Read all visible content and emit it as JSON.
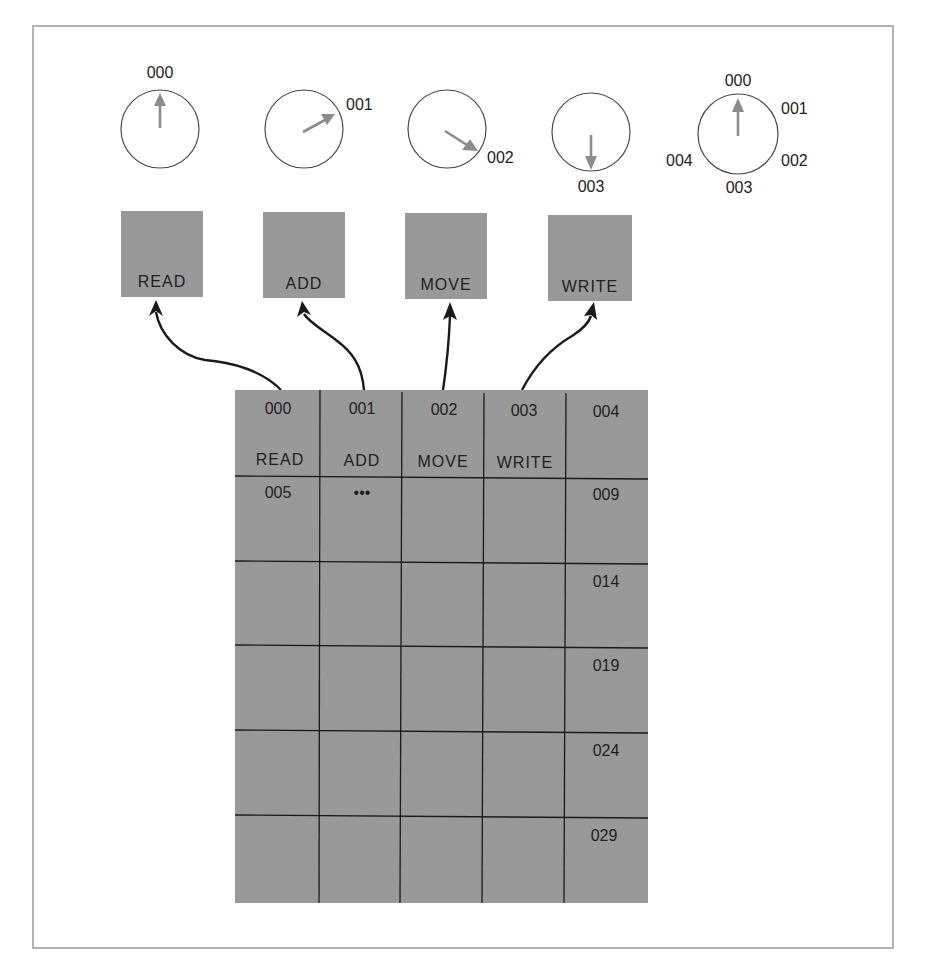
{
  "dials": [
    {
      "label": "000",
      "angle_deg": 0
    },
    {
      "label": "001",
      "angle_deg": 62
    },
    {
      "label": "002",
      "angle_deg": 120
    },
    {
      "label": "003",
      "angle_deg": 180
    }
  ],
  "legend_dial": {
    "pointer_label": "000",
    "positions": [
      "000",
      "001",
      "002",
      "003",
      "004"
    ]
  },
  "instruction_boxes": [
    {
      "label": "READ"
    },
    {
      "label": "ADD"
    },
    {
      "label": "MOVE"
    },
    {
      "label": "WRITE"
    }
  ],
  "memory_grid": {
    "columns": 5,
    "rows": 6,
    "cells": {
      "r0": [
        {
          "address": "000",
          "content": "READ"
        },
        {
          "address": "001",
          "content": "ADD"
        },
        {
          "address": "002",
          "content": "MOVE"
        },
        {
          "address": "003",
          "content": "WRITE"
        },
        {
          "address": "004",
          "content": ""
        }
      ],
      "r1": {
        "first": "005",
        "ellipsis": "•••",
        "last": "009"
      },
      "row_end_labels": [
        "004",
        "009",
        "014",
        "019",
        "024",
        "029"
      ]
    }
  },
  "colors": {
    "box_fill": "#999999",
    "grid_fill": "#999999",
    "needle": "#8c8c8c",
    "line": "#1a1a1a"
  }
}
